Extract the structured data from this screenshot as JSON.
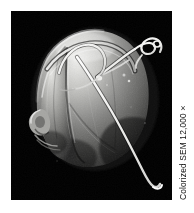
{
  "figure": {
    "name": "sem-micrograph-figure",
    "background_color": "#ffffff"
  },
  "photo": {
    "name": "sem-micrograph",
    "background_color": "#000000",
    "subject": "dinoflagellate cell with coiled transverse flagellum and long trailing longitudinal flagellum",
    "alt_text": "Colorized scanning electron micrograph of a rounded lobed single-celled organism with two flagella",
    "tone_light": "#f2f2f0",
    "tone_mid": "#9a9a98",
    "tone_dark": "#3a3a3a",
    "tone_shadow": "#141414"
  },
  "caption": {
    "name": "magnification-caption",
    "text": "Colorized SEM 12,000×",
    "color": "#111111",
    "orientation": "vertical-bottom-to-top"
  }
}
